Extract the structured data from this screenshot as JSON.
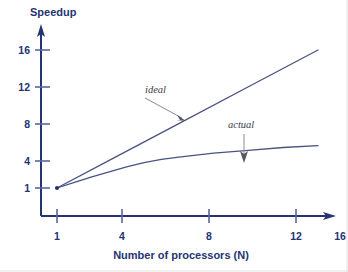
{
  "chart_data": {
    "type": "line",
    "title": "",
    "ylabel": "Speedup",
    "xlabel": "Number of processors (N)",
    "xlim": [
      1,
      16
    ],
    "ylim": [
      1,
      17
    ],
    "xticks": [
      "1",
      "4",
      "8",
      "12",
      "16"
    ],
    "xtick_values": [
      1,
      4,
      8,
      12,
      16
    ],
    "yticks": [
      "1",
      "4",
      "8",
      "12",
      "16"
    ],
    "ytick_values": [
      1,
      4,
      8,
      12,
      16
    ],
    "grid": false,
    "legend_position": "inline-annotations",
    "series": [
      {
        "name": "ideal",
        "x": [
          1,
          4,
          8,
          12,
          16
        ],
        "values": [
          1,
          4,
          8,
          12,
          16
        ]
      },
      {
        "name": "actual",
        "x": [
          1,
          2,
          3,
          4,
          5,
          6,
          7,
          8,
          10,
          12,
          14,
          16
        ],
        "values": [
          1,
          1.6,
          2.2,
          2.75,
          3.3,
          3.75,
          4.1,
          4.35,
          4.8,
          5.1,
          5.4,
          5.6
        ]
      }
    ],
    "annotations": [
      {
        "text": "ideal",
        "label_x": 6.6,
        "label_y": 11.1,
        "target_x": 8.4,
        "target_y": 8.4
      },
      {
        "text": "actual",
        "label_x": 11.1,
        "label_y": 7.6,
        "target_x": 11.6,
        "target_y": 5.3
      }
    ]
  },
  "colors": {
    "axis": "#243472",
    "text": "#243472",
    "series_line": "#4a5282",
    "annotation_text": "#3b3b46",
    "annotation_arrow": "#8a8a96",
    "background": "#ffffff"
  }
}
